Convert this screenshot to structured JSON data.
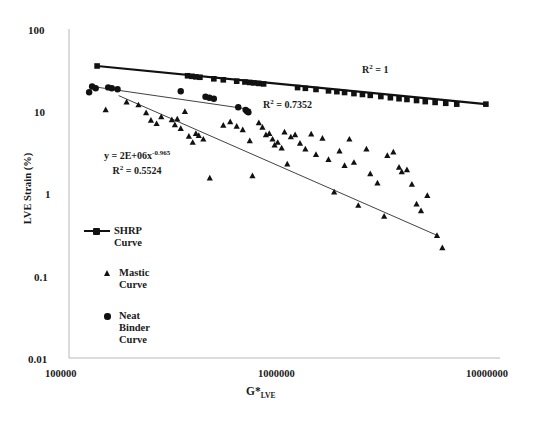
{
  "chart_data": {
    "type": "scatter",
    "title": "",
    "xlabel": "G*LVE",
    "xlabel_main": "G*",
    "xlabel_sub": "LVE",
    "ylabel": "LVE Strain (%)",
    "xscale": "log",
    "yscale": "log",
    "xlim": [
      100000,
      10000000
    ],
    "ylim": [
      0.01,
      100
    ],
    "grid": false,
    "xticks": [
      100000,
      1000000,
      10000000
    ],
    "xtick_labels": [
      "100000",
      "1000000",
      "10000000"
    ],
    "yticks": [
      100,
      10,
      1,
      0.1,
      0.01
    ],
    "ytick_labels": [
      "100",
      "10",
      "1",
      "0.1",
      "0.01"
    ],
    "legend_position": "inside-lower-left",
    "annotations": [
      {
        "name": "mastic-fit-equation",
        "text": "y = 2E+06x-0.965",
        "base": "y = 2E+06x",
        "exponent": "-0.965"
      },
      {
        "name": "mastic-fit-r2",
        "text": "R2 = 0.5524",
        "base": "R",
        "sup": "2",
        "value": " = 0.5524"
      },
      {
        "name": "shrp-fit-r2",
        "text": "R2 = 1",
        "base": "R",
        "sup": "2",
        "value": " = 1"
      },
      {
        "name": "neat-binder-fit-r2",
        "text": "R2 = 0.7352",
        "base": "R",
        "sup": "2",
        "value": " = 0.7352"
      }
    ],
    "series": [
      {
        "name": "SHRP Curve",
        "marker": "square",
        "color": "#111111",
        "has_trendline": true,
        "trendline": {
          "x": [
            135000,
            8600000
          ],
          "y": [
            35.5,
            12.2
          ]
        },
        "r_squared": 1,
        "points": [
          [
            135000,
            35.5
          ],
          [
            355000,
            27.0
          ],
          [
            372000,
            26.6
          ],
          [
            388000,
            26.2
          ],
          [
            405000,
            25.9
          ],
          [
            470000,
            24.8
          ],
          [
            520000,
            24.1
          ],
          [
            600000,
            23.2
          ],
          [
            655000,
            22.7
          ],
          [
            690000,
            22.4
          ],
          [
            720000,
            22.1
          ],
          [
            760000,
            21.8
          ],
          [
            800000,
            21.5
          ],
          [
            1150000,
            19.4
          ],
          [
            1250000,
            19.0
          ],
          [
            1400000,
            18.4
          ],
          [
            1600000,
            17.7
          ],
          [
            1750000,
            17.3
          ],
          [
            1900000,
            16.9
          ],
          [
            2100000,
            16.4
          ],
          [
            2300000,
            16.0
          ],
          [
            2500000,
            15.6
          ],
          [
            2800000,
            15.1
          ],
          [
            3100000,
            14.6
          ],
          [
            3400000,
            14.2
          ],
          [
            3700000,
            13.9
          ],
          [
            4100000,
            13.5
          ],
          [
            4500000,
            13.1
          ],
          [
            5000000,
            12.8
          ],
          [
            5600000,
            12.5
          ],
          [
            6300000,
            12.2
          ],
          [
            8600000,
            12.2
          ]
        ]
      },
      {
        "name": "Neat Binder Curve",
        "marker": "circle",
        "color": "#111111",
        "has_trendline": true,
        "trendline": {
          "x": [
            128000,
            700000
          ],
          "y": [
            20.0,
            10.5
          ]
        },
        "r_squared": 0.7352,
        "points": [
          [
            124000,
            17.0
          ],
          [
            128000,
            20.0
          ],
          [
            133000,
            19.0
          ],
          [
            152000,
            19.5
          ],
          [
            158000,
            19.0
          ],
          [
            168000,
            18.5
          ],
          [
            330000,
            17.5
          ],
          [
            430000,
            15.0
          ],
          [
            448000,
            14.6
          ],
          [
            470000,
            14.2
          ],
          [
            610000,
            11.2
          ],
          [
            660000,
            10.4
          ],
          [
            670000,
            10.0
          ],
          [
            680000,
            9.7
          ]
        ]
      },
      {
        "name": "Mastic Curve",
        "marker": "triangle",
        "color": "#111111",
        "has_trendline": true,
        "trendline": {
          "x": [
            170000,
            5100000
          ],
          "y": [
            15.5,
            0.31
          ]
        },
        "r_squared": 0.5524,
        "fit_equation": "y = 2E+06x-0.965",
        "points": [
          [
            148000,
            10.5
          ],
          [
            185000,
            13.0
          ],
          [
            210000,
            12.0
          ],
          [
            228000,
            9.6
          ],
          [
            240000,
            7.8
          ],
          [
            255000,
            7.1
          ],
          [
            268000,
            8.6
          ],
          [
            300000,
            7.9
          ],
          [
            310000,
            6.9
          ],
          [
            318000,
            8.1
          ],
          [
            330000,
            6.2
          ],
          [
            345000,
            10.0
          ],
          [
            360000,
            5.0
          ],
          [
            375000,
            4.2
          ],
          [
            388000,
            5.4
          ],
          [
            400000,
            5.1
          ],
          [
            420000,
            4.6
          ],
          [
            450000,
            1.55
          ],
          [
            520000,
            6.8
          ],
          [
            560000,
            7.5
          ],
          [
            600000,
            6.6
          ],
          [
            640000,
            6.0
          ],
          [
            690000,
            4.4
          ],
          [
            710000,
            1.65
          ],
          [
            760000,
            7.3
          ],
          [
            790000,
            6.4
          ],
          [
            820000,
            5.2
          ],
          [
            850000,
            5.4
          ],
          [
            880000,
            4.6
          ],
          [
            900000,
            3.9
          ],
          [
            930000,
            4.2
          ],
          [
            970000,
            3.6
          ],
          [
            1000000,
            5.6
          ],
          [
            1030000,
            2.3
          ],
          [
            1070000,
            4.9
          ],
          [
            1120000,
            5.2
          ],
          [
            1180000,
            4.1
          ],
          [
            1250000,
            3.5
          ],
          [
            1330000,
            5.3
          ],
          [
            1400000,
            3.0
          ],
          [
            1500000,
            4.7
          ],
          [
            1600000,
            2.6
          ],
          [
            1700000,
            1.05
          ],
          [
            1800000,
            3.3
          ],
          [
            1900000,
            2.2
          ],
          [
            2000000,
            4.6
          ],
          [
            2100000,
            2.4
          ],
          [
            2200000,
            0.72
          ],
          [
            2400000,
            3.5
          ],
          [
            2500000,
            1.75
          ],
          [
            2700000,
            1.35
          ],
          [
            2900000,
            0.53
          ],
          [
            3000000,
            2.9
          ],
          [
            3200000,
            3.2
          ],
          [
            3400000,
            2.1
          ],
          [
            3500000,
            1.85
          ],
          [
            3700000,
            1.95
          ],
          [
            3900000,
            1.3
          ],
          [
            4100000,
            0.75
          ],
          [
            4300000,
            0.62
          ],
          [
            4600000,
            0.95
          ],
          [
            5100000,
            0.31
          ],
          [
            5400000,
            0.22
          ]
        ]
      }
    ]
  },
  "axes": {
    "ylabel": "LVE Strain (%)",
    "xlabel_main": "G*",
    "xlabel_sub": "LVE",
    "ytick_100": "100",
    "ytick_10": "10",
    "ytick_1": "1",
    "ytick_01": "0.1",
    "ytick_001": "0.01",
    "xtick_1e5": "100000",
    "xtick_1e6": "1000000",
    "xtick_1e7": "10000000"
  },
  "annotations": {
    "equation_base": "y = 2E+06x",
    "equation_exponent": "-0.965",
    "equation_r2_base": "R",
    "equation_r2_sup": "2",
    "equation_r2_value": " = 0.5524",
    "shrp_r2_base": "R",
    "shrp_r2_sup": "2",
    "shrp_r2_value": " = 1",
    "binder_r2_base": "R",
    "binder_r2_sup": "2",
    "binder_r2_value": " = 0.7352"
  },
  "legend": {
    "items": [
      {
        "label_line1": "SHRP",
        "label_line2": "Curve",
        "marker": "line-square"
      },
      {
        "label_line1": "Mastic",
        "label_line2": "Curve",
        "marker": "triangle"
      },
      {
        "label_line1": "Neat",
        "label_line2": "Binder",
        "label_line3": "Curve",
        "marker": "circle"
      }
    ]
  }
}
